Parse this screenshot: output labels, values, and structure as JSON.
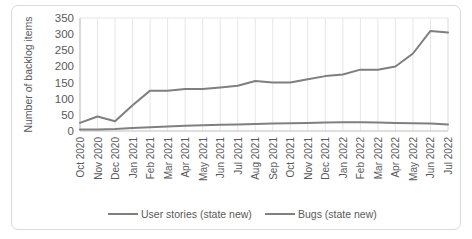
{
  "chart_data": {
    "type": "line",
    "title": "",
    "xlabel": "",
    "ylabel": "Number of backlog items",
    "ylim": [
      0,
      350
    ],
    "ytick_step": 50,
    "yticks": [
      "0",
      "50",
      "100",
      "150",
      "200",
      "250",
      "300",
      "350"
    ],
    "grid": "vertical",
    "legend_position": "bottom",
    "categories": [
      "Oct 2020",
      "Nov 2020",
      "Dec 2020",
      "Jan 2021",
      "Feb 2021",
      "Mar 2021",
      "Apr 2021",
      "May 2021",
      "Jun 2021",
      "Jul 2021",
      "Aug 2021",
      "Sep 2021",
      "Oct 2021",
      "Nov 2021",
      "Dec 2021",
      "Jan 2022",
      "Feb 2022",
      "Mar 2022",
      "Apr 2022",
      "May 2022",
      "Jun 2022",
      "Jul 2022"
    ],
    "series": [
      {
        "name": "User stories (state new)",
        "color": "#7f7f7f",
        "values": [
          25,
          45,
          30,
          80,
          125,
          125,
          130,
          130,
          135,
          140,
          155,
          150,
          150,
          160,
          170,
          175,
          190,
          190,
          200,
          240,
          310,
          305
        ]
      },
      {
        "name": "Bugs (state new)",
        "color": "#808080",
        "values": [
          5,
          5,
          6,
          9,
          12,
          14,
          16,
          18,
          19,
          20,
          22,
          23,
          24,
          25,
          26,
          27,
          27,
          26,
          25,
          24,
          23,
          20
        ]
      }
    ]
  },
  "colors": {
    "axis": "#bfbfbf",
    "grid": "#e6e6e6",
    "text": "#595959",
    "card_border": "#d9d9d9",
    "background": "#ffffff"
  }
}
